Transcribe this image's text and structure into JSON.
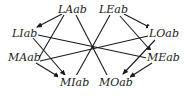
{
  "diagram": {
    "type": "directed-graph",
    "center_crossing": {
      "x": 93,
      "y": 47
    },
    "nodes": [
      {
        "id": "LAab",
        "label": "LAab",
        "x": 72,
        "y": 10
      },
      {
        "id": "LEab",
        "label": "LEab",
        "x": 113,
        "y": 10
      },
      {
        "id": "LIab",
        "label": "LIab",
        "x": 22,
        "y": 34
      },
      {
        "id": "LOab",
        "label": "LOab",
        "x": 163,
        "y": 34
      },
      {
        "id": "MAab",
        "label": "MAab",
        "x": 22,
        "y": 58
      },
      {
        "id": "MEab",
        "label": "MEab",
        "x": 163,
        "y": 58
      },
      {
        "id": "MIab",
        "label": "MIab",
        "x": 72,
        "y": 81
      },
      {
        "id": "MOab",
        "label": "MOab",
        "x": 113,
        "y": 81
      }
    ],
    "edges": [
      {
        "from": "LAab",
        "to": "LIab",
        "arrow": true
      },
      {
        "from": "LAab",
        "to": "MAab",
        "arrow": false
      },
      {
        "from": "LAab",
        "to": "MOab",
        "arrow": false,
        "via_center": true
      },
      {
        "from": "LEab",
        "to": "LOab",
        "arrow": true
      },
      {
        "from": "LEab",
        "to": "MEab",
        "arrow": true
      },
      {
        "from": "LEab",
        "to": "MIab",
        "arrow": false,
        "via_center": true
      },
      {
        "from": "LIab",
        "to": "MEab",
        "arrow": false,
        "via_center": true
      },
      {
        "from": "LIab",
        "to": "MIab",
        "arrow": true
      },
      {
        "from": "MAab",
        "to": "LOab",
        "arrow": false,
        "via_center": true
      },
      {
        "from": "MAab",
        "to": "MIab",
        "arrow": true
      },
      {
        "from": "LOab",
        "to": "MOab",
        "arrow": true
      },
      {
        "from": "MEab",
        "to": "MOab",
        "arrow": true
      }
    ]
  }
}
